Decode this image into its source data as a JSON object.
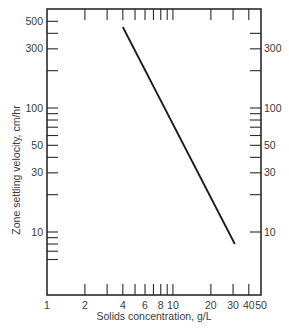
{
  "chart_data": {
    "type": "line",
    "title": "",
    "xlabel": "Solids concentration, g/L",
    "ylabel": "Zone settling velocity, cm/hr",
    "xscale": "log",
    "yscale": "log",
    "xlim": [
      1,
      50
    ],
    "ylim": [
      5,
      600
    ],
    "grid": false,
    "legend": null,
    "x_ticks": {
      "major": [
        1,
        2,
        4,
        6,
        8,
        10,
        20,
        30,
        40,
        50
      ],
      "labels": [
        "1",
        "2",
        "4",
        "6",
        "8",
        "10",
        "20",
        "30",
        "40",
        "50"
      ],
      "minor": [
        3,
        5,
        7,
        9
      ]
    },
    "y_ticks_left": {
      "labeled": [
        500,
        300,
        100,
        50,
        30,
        10
      ],
      "labels": [
        "500",
        "300",
        "100",
        "50",
        "30",
        "10"
      ],
      "unlabeled": [
        400,
        200,
        90,
        80,
        70,
        60,
        40,
        20,
        9,
        8,
        7,
        6
      ]
    },
    "y_ticks_right": {
      "labeled": [
        300,
        100,
        50,
        30,
        10
      ],
      "labels": [
        "300",
        "100",
        "50",
        "30",
        "10"
      ],
      "unlabeled": [
        400,
        200,
        90,
        80,
        70,
        60,
        40,
        20
      ]
    },
    "series": [
      {
        "name": "Zone settling velocity",
        "x": [
          4,
          31
        ],
        "y": [
          450,
          8
        ]
      }
    ],
    "colors": {
      "line": "#1a1a1a",
      "axis": "#2a2a2a",
      "text": "#3a3a3a"
    }
  }
}
